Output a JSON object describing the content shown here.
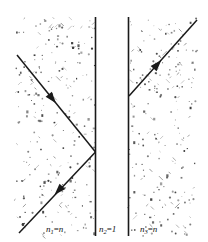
{
  "figure": {
    "width": 208,
    "height": 242,
    "background_color": "#ffffff",
    "ink_color": "#1a1a1a",
    "speckle_color": "#3a3a3a"
  },
  "regions": [
    {
      "id": "region-1",
      "label_full": "n1=n",
      "label_symbol": "n",
      "label_subscript": "1",
      "label_equals": "=",
      "label_value": "n",
      "description": "left medium, refractive index n",
      "x_start": 15,
      "x_end": 95,
      "speckled": true,
      "label_x": 46,
      "label_y": 232
    },
    {
      "id": "region-2",
      "label_full": "n2=1",
      "label_symbol": "n",
      "label_subscript": "2",
      "label_equals": "=",
      "label_value": "1",
      "description": "thin air gap, refractive index 1",
      "x_start": 96,
      "x_end": 128,
      "speckled": false,
      "label_x": 99,
      "label_y": 232
    },
    {
      "id": "region-3",
      "label_full": "n3=n",
      "label_symbol": "n",
      "label_subscript": "3",
      "label_equals": "=",
      "label_value": "n",
      "description": "right medium, refractive index n",
      "x_start": 129,
      "x_end": 197,
      "speckled": true,
      "label_x": 140,
      "label_y": 232
    }
  ],
  "boundaries": [
    {
      "id": "boundary-1",
      "description": "interface between region 1 and the air gap",
      "x": 95.5,
      "y_top": 17,
      "y_bottom": 236,
      "width": 1.6
    },
    {
      "id": "boundary-2",
      "description": "interface between the air gap and region 3",
      "x": 128.5,
      "y_top": 17,
      "y_bottom": 236,
      "width": 1.6
    }
  ],
  "rays": [
    {
      "id": "incident-ray",
      "description": "incident ray travelling down-right toward boundary 1",
      "x1": 17,
      "y1": 55,
      "x2": 95.5,
      "y2": 152,
      "arrow": {
        "x": 51,
        "y": 97,
        "angle_deg": 51,
        "size": 8
      }
    },
    {
      "id": "reflected-ray",
      "description": "totally internally reflected ray travelling down-left from boundary 1",
      "x1": 95.5,
      "y1": 152,
      "x2": 19,
      "y2": 233,
      "arrow": {
        "x": 60,
        "y": 189,
        "angle_deg": 133,
        "size": 8
      }
    },
    {
      "id": "transmitted-ray",
      "description": "frustrated-transmission ray emerging in region 3, travelling up-right",
      "x1": 129,
      "y1": 96,
      "x2": 197,
      "y2": 20,
      "arrow": {
        "x": 156,
        "y": 66,
        "angle_deg": -48,
        "size": 8
      }
    }
  ],
  "speckle": {
    "description": "random stipple texture filling the two high-index media",
    "seed": 20250614,
    "dot_count_left": 260,
    "dot_count_right": 235,
    "min_size": 0.7,
    "max_size": 2.3,
    "y_top": 18,
    "y_bottom": 236
  }
}
